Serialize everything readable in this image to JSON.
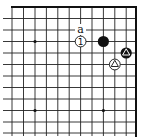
{
  "board": {
    "corner": "top-right",
    "line_color": "#222222",
    "background": "#ffffff",
    "columns_x": [
      12,
      23.5,
      35,
      46.4,
      57.8,
      69.2,
      80.6,
      92,
      103.4,
      114.8,
      126.2,
      136
    ],
    "rows_y": [
      7,
      18.5,
      30,
      41.5,
      53,
      64.5,
      76,
      87.5,
      99,
      110.5,
      122,
      133
    ],
    "star_points": [
      {
        "col": 2,
        "row": 3
      },
      {
        "col": 2,
        "row": 9
      },
      {
        "col": 8,
        "row": 9
      }
    ]
  },
  "stones": [
    {
      "color": "white",
      "col": 6,
      "row": 3,
      "label": "1",
      "marker": "number"
    },
    {
      "color": "black",
      "col": 8,
      "row": 3,
      "label": "",
      "marker": "none"
    },
    {
      "color": "black",
      "col": 10,
      "row": 4,
      "label": "",
      "marker": "triangle"
    },
    {
      "color": "white",
      "col": 9,
      "row": 5,
      "label": "",
      "marker": "triangle"
    }
  ],
  "annotations": [
    {
      "text": "a",
      "col": 6,
      "row": 2
    }
  ]
}
